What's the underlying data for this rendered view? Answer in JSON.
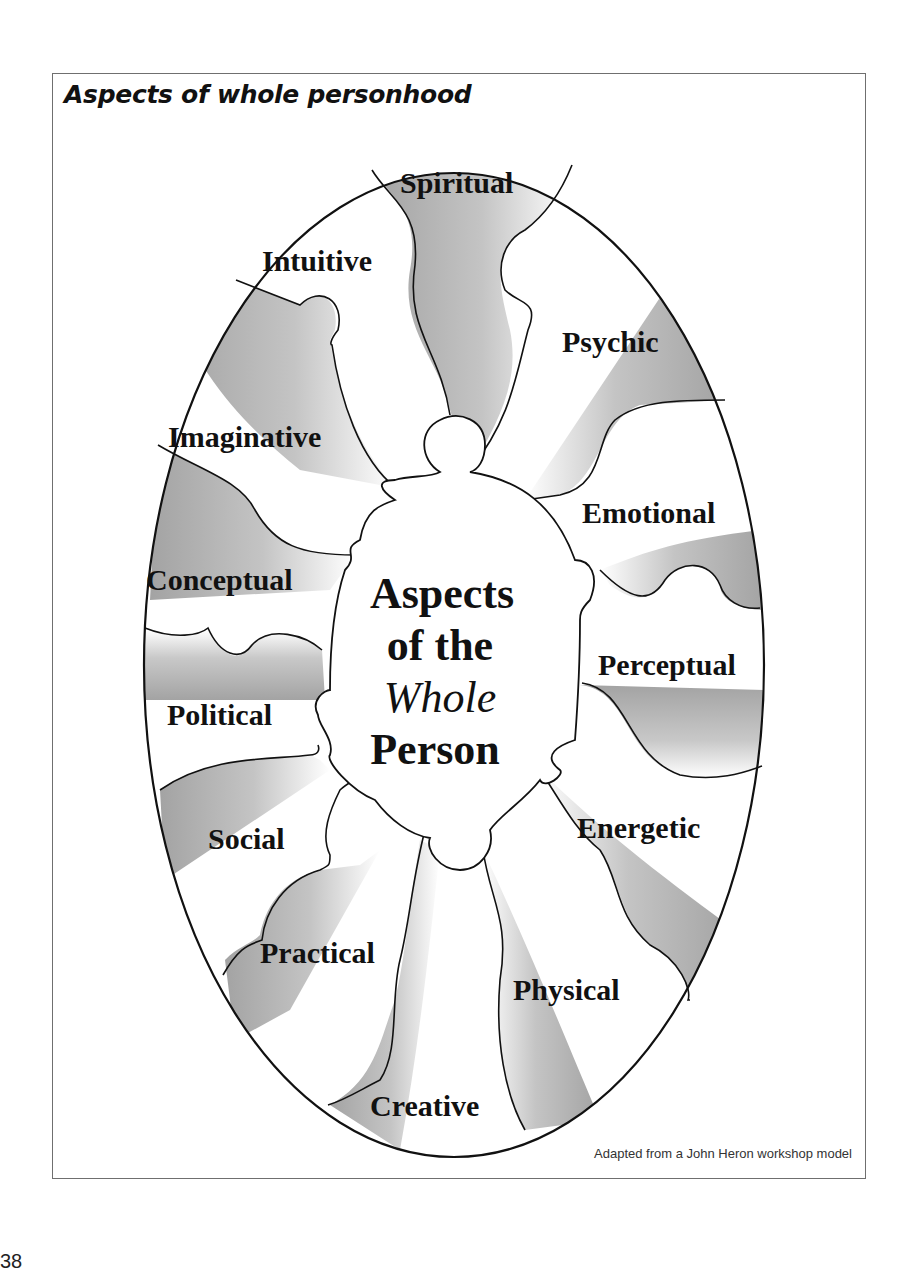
{
  "title": "Aspects of whole personhood",
  "caption": "Adapted from a John Heron workshop model",
  "page_number": "38",
  "center": {
    "line1": "Aspects",
    "line2": "of the",
    "line3": "Whole",
    "line4": "Person"
  },
  "aspects": [
    {
      "label": "Spiritual"
    },
    {
      "label": "Psychic"
    },
    {
      "label": "Emotional"
    },
    {
      "label": "Perceptual"
    },
    {
      "label": "Energetic"
    },
    {
      "label": "Physical"
    },
    {
      "label": "Creative"
    },
    {
      "label": "Practical"
    },
    {
      "label": "Social"
    },
    {
      "label": "Political"
    },
    {
      "label": "Conceptual"
    },
    {
      "label": "Imaginative"
    },
    {
      "label": "Intuitive"
    }
  ],
  "colors": {
    "shade_dark": "#9a9a9a",
    "shade_light": "#ffffff",
    "outline": "#111111",
    "frame": "#6f6f6f"
  }
}
